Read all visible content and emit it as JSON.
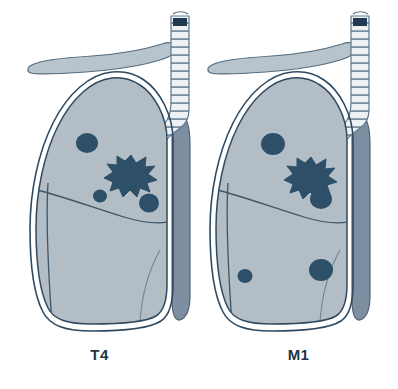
{
  "figure": {
    "background_color": "#ffffff",
    "width": 398,
    "height": 389
  },
  "palette": {
    "background": "#ffffff",
    "lung_fill": "#b3bdc5",
    "lung_fill_light": "#c3ccd3",
    "pleura_line": "#2f4a60",
    "pleura_gap": "#fdfdfd",
    "clavicle_fill": "#b8c4cc",
    "clavicle_outline": "#4a6276",
    "trachea_ring": "#e9eef1",
    "trachea_line": "#60788c",
    "trachea_lumen": "#1e3a52",
    "mediastinum_fill": "#7d8ea0",
    "mediastinum_outline": "#47596a",
    "nodule_fill": "#2d5068",
    "tumor_fill": "#2d5068",
    "fissure_line": "#3c5568",
    "label_color": "#1f3448"
  },
  "panels": [
    {
      "id": "t4",
      "label": "T4",
      "stage_name": "T4",
      "anatomy": {
        "clavicle": "clavicle-shape",
        "trachea": "trachea-shape",
        "mediastinum": "mediastinum-column",
        "lung": "right-lung-silhouette",
        "fissures": [
          "horizontal-fissure",
          "oblique-fissure"
        ]
      },
      "primary_tumor": {
        "name": "spiculated-primary-tumor",
        "cx": 131,
        "cy": 173,
        "r": 18,
        "points": 11
      },
      "nodules": [
        {
          "name": "nodule-upper-lobe",
          "cx": 87,
          "cy": 143,
          "rx": 11,
          "ry": 10
        },
        {
          "name": "nodule-mid-small",
          "cx": 100,
          "cy": 196,
          "rx": 7,
          "ry": 6.5
        },
        {
          "name": "nodule-mid-lateral",
          "cx": 149,
          "cy": 203,
          "rx": 10,
          "ry": 9.5
        }
      ]
    },
    {
      "id": "m1",
      "label": "M1",
      "stage_name": "M1",
      "anatomy": {
        "clavicle": "clavicle-shape",
        "trachea": "trachea-shape",
        "mediastinum": "mediastinum-column",
        "lung": "right-lung-silhouette",
        "fissures": [
          "horizontal-fissure",
          "oblique-fissure"
        ]
      },
      "primary_tumor": {
        "name": "spiculated-primary-tumor",
        "cx": 112,
        "cy": 175,
        "r": 18,
        "points": 11
      },
      "nodules": [
        {
          "name": "nodule-upper-lobe",
          "cx": 74,
          "cy": 144,
          "rx": 12,
          "ry": 11
        },
        {
          "name": "nodule-mid-lateral",
          "cx": 122,
          "cy": 199,
          "rx": 11,
          "ry": 10
        },
        {
          "name": "nodule-lower-lobe-small",
          "cx": 46,
          "cy": 276,
          "rx": 7.5,
          "ry": 7
        },
        {
          "name": "nodule-lower-lobe-large",
          "cx": 122,
          "cy": 270,
          "rx": 12,
          "ry": 11
        }
      ]
    }
  ]
}
